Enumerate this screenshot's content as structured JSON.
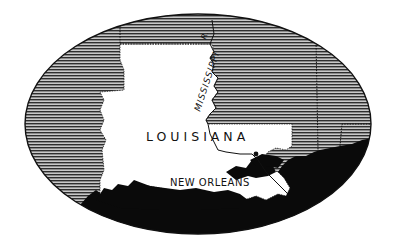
{
  "map": {
    "state_label": "LOUISIANA",
    "river_label": "MISSISSIPPI",
    "river_abbrev": "R.",
    "city_label": "NEW ORLEANS",
    "colors": {
      "land_highlight": "#ffffff",
      "surrounding_land": "#9a9a9a",
      "hatch_line": "#333333",
      "water": "#0a0a0a",
      "border": "#111111",
      "background": "#ffffff"
    }
  }
}
